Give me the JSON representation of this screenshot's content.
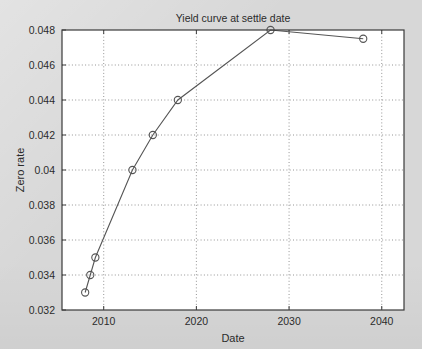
{
  "chart_data": {
    "type": "line",
    "title": "Yield curve at settle date",
    "xlabel": "Date",
    "ylabel": "Zero rate",
    "xlim": [
      2005.5,
      2042.4
    ],
    "ylim": [
      0.032,
      0.048
    ],
    "xticks": [
      2010,
      2020,
      2030,
      2040
    ],
    "xticklabels": [
      "2010",
      "2020",
      "2030",
      "2040"
    ],
    "yticks": [
      0.032,
      0.034,
      0.036,
      0.038,
      0.04,
      0.042,
      0.044,
      0.046,
      0.048
    ],
    "yticklabels": [
      "0.032",
      "0.034",
      "0.036",
      "0.038",
      "0.04",
      "0.042",
      "0.044",
      "0.046",
      "0.048"
    ],
    "grid": true,
    "grid_style": "dotted",
    "legend": null,
    "marker": "circle-open",
    "line_color": "#555555",
    "marker_color": "#555555",
    "plot_bg": "#ffffff",
    "figure_bg": "#d7d7d7",
    "series": [
      {
        "name": "Zero rate",
        "x": [
          2008.0,
          2008.55,
          2009.1,
          2013.1,
          2015.3,
          2018.0,
          2028.0,
          2038.0
        ],
        "y": [
          0.033,
          0.034,
          0.035,
          0.04,
          0.042,
          0.044,
          0.048,
          0.0475
        ]
      }
    ]
  }
}
